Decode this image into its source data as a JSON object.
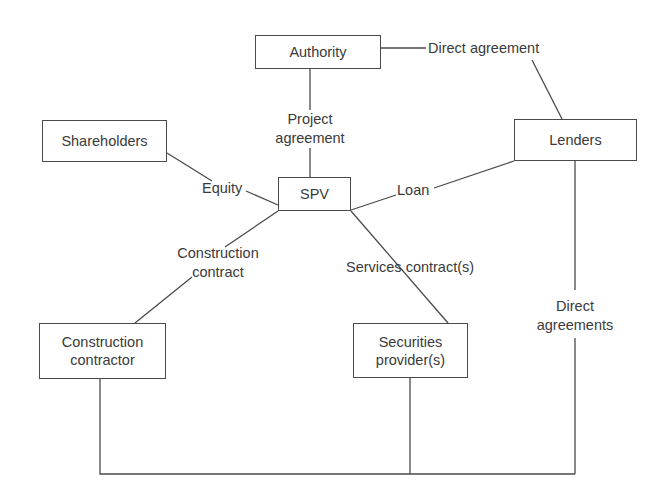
{
  "diagram": {
    "type": "project-finance-structure",
    "nodes": {
      "authority": {
        "label": "Authority"
      },
      "shareholders": {
        "label": "Shareholders"
      },
      "spv": {
        "label": "SPV"
      },
      "lenders": {
        "label": "Lenders"
      },
      "construction_contractor": {
        "label": "Construction\ncontractor"
      },
      "securities_provider": {
        "label": "Securities\nprovider(s)"
      }
    },
    "edges": {
      "project_agreement": {
        "label": "Project\nagreement",
        "from": "authority",
        "to": "spv"
      },
      "direct_agreement": {
        "label": "Direct agreement",
        "from": "authority",
        "to": "lenders"
      },
      "equity": {
        "label": "Equity",
        "from": "shareholders",
        "to": "spv"
      },
      "loan": {
        "label": "Loan",
        "from": "spv",
        "to": "lenders"
      },
      "construction_contract": {
        "label": "Construction\ncontract",
        "from": "spv",
        "to": "construction_contractor"
      },
      "services_contracts": {
        "label": "Services contract(s)",
        "from": "spv",
        "to": "securities_provider"
      },
      "direct_agreements": {
        "label": "Direct\nagreements",
        "from": "lenders",
        "to": [
          "construction_contractor",
          "securities_provider"
        ]
      }
    }
  }
}
